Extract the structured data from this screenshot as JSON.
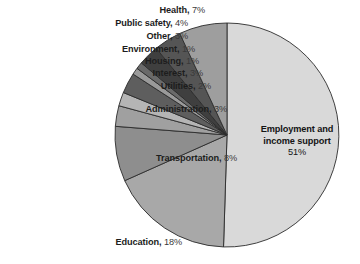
{
  "chart_data": {
    "type": "pie",
    "title": "",
    "subtitle": "",
    "xlabel": "",
    "ylabel": "",
    "legend_position": "none",
    "grid": false,
    "units": "percent",
    "start_angle_deg": 0,
    "direction": "clockwise",
    "categories": [
      "Employment and income support",
      "Education",
      "Transportation",
      "Administration",
      "Utilities",
      "Interest",
      "Housing",
      "Environment",
      "Other",
      "Public safety",
      "Health"
    ],
    "values": [
      51,
      18,
      8,
      3,
      2,
      3,
      1,
      1,
      3,
      4,
      7
    ],
    "slices": [
      {
        "label": "Employment and income support",
        "value": 51,
        "value_text": "51%",
        "color": "#d9d9d9",
        "label_placement": "inside",
        "label_line1": "Employment and",
        "label_line2": "income support"
      },
      {
        "label": "Education",
        "value": 18,
        "value_text": "18%",
        "color": "#a8a8a8",
        "label_placement": "outside",
        "label_text": "Education,",
        "pct_text": "18%"
      },
      {
        "label": "Transportation",
        "value": 8,
        "value_text": "8%",
        "color": "#8e8e8e",
        "label_placement": "outside",
        "label_text": "Transportation,",
        "pct_text": "8%"
      },
      {
        "label": "Administration",
        "value": 3,
        "value_text": "3%",
        "color": "#a0a0a0",
        "label_placement": "outside",
        "label_text": "Administration,",
        "pct_text": "3%"
      },
      {
        "label": "Utilities",
        "value": 2,
        "value_text": "2%",
        "color": "#b5b5b5",
        "label_placement": "outside",
        "label_text": "Utilities,",
        "pct_text": "2%"
      },
      {
        "label": "Interest",
        "value": 3,
        "value_text": "3%",
        "color": "#5e5e5e",
        "label_placement": "outside",
        "label_text": "Interest,",
        "pct_text": "3%"
      },
      {
        "label": "Housing",
        "value": 1,
        "value_text": "1%",
        "color": "#9a9a9a",
        "label_placement": "outside",
        "label_text": "Housing,",
        "pct_text": "1%"
      },
      {
        "label": "Environment",
        "value": 1,
        "value_text": "1%",
        "color": "#6a6a6a",
        "label_placement": "outside",
        "label_text": "Environment,",
        "pct_text": "1%"
      },
      {
        "label": "Other",
        "value": 3,
        "value_text": "3%",
        "color": "#3f3f3f",
        "label_placement": "outside",
        "label_text": "Other,",
        "pct_text": "3%"
      },
      {
        "label": "Public safety",
        "value": 4,
        "value_text": "4%",
        "color": "#555555",
        "label_placement": "outside",
        "label_text": "Public safety,",
        "pct_text": "4%"
      },
      {
        "label": "Health",
        "value": 7,
        "value_text": "7%",
        "color": "#9e9e9e",
        "label_placement": "outside",
        "label_text": "Health,",
        "pct_text": "7%"
      }
    ]
  },
  "geometry": {
    "center_x": 227,
    "center_y": 135,
    "radius": 112,
    "stroke_color": "#2b2b2b",
    "background": "#ffffff"
  }
}
